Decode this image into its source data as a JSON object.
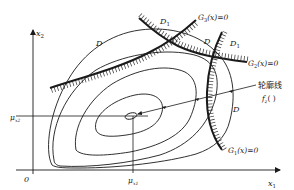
{
  "diagram": {
    "title": "",
    "axes": {
      "x_label": "x",
      "x_sub": "1",
      "y_label": "x",
      "y_sub": "2",
      "origin": "0"
    },
    "mean_marks": {
      "mu_x1": "μ",
      "mu_x1_sub": "x1",
      "mu_x2": "μ",
      "mu_x2_sub": "x2"
    },
    "regions": {
      "D_left": "D",
      "D_top": "D",
      "D_right": "D",
      "D1_top": "D",
      "D1_top_sub": "1",
      "D1_right": "D",
      "D1_right_sub": "1"
    },
    "constraints": [
      {
        "name": "G3",
        "label": "G",
        "sub": "3",
        "expr": "(x)=0"
      },
      {
        "name": "G2",
        "label": "G",
        "sub": "2",
        "expr": "(x)=0"
      },
      {
        "name": "G1",
        "label": "G",
        "sub": "1",
        "expr": "(x)=0"
      }
    ],
    "contour_label": {
      "text": "轮廓线",
      "func": "f",
      "func_sub": "z",
      "func_args": "( )"
    },
    "colors": {
      "ink": "#1a1a1a",
      "background": "#ffffff"
    }
  }
}
